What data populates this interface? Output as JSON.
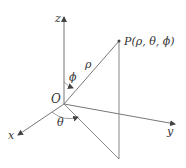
{
  "figure": {
    "axes": {
      "x_label": "x",
      "y_label": "y",
      "z_label": "z"
    },
    "origin_label": "O",
    "point_label": "P(ρ, θ, ϕ)",
    "rho_label": "ρ",
    "theta_label": "θ",
    "phi_label": "ϕ"
  },
  "colors": {
    "line": "#555555",
    "text": "#333333",
    "background": "#ffffff"
  }
}
